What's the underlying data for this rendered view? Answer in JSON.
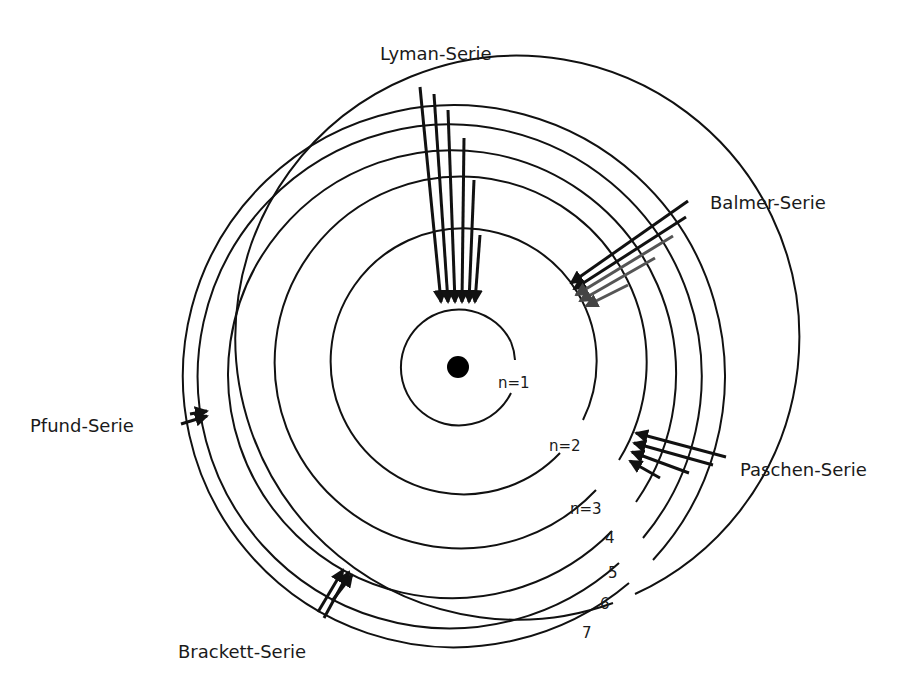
{
  "diagram": {
    "nucleus": {
      "label": ""
    },
    "orbit_labels": [
      "n=1",
      "n=2",
      "n=3",
      "4",
      "5",
      "6",
      "7"
    ],
    "series": [
      {
        "name": "Lyman-Serie",
        "target_level": 1,
        "transitions_from": [
          2,
          3,
          4,
          5,
          6,
          7
        ]
      },
      {
        "name": "Balmer-Serie",
        "target_level": 2,
        "transitions_from": [
          3,
          4,
          5,
          6,
          7
        ]
      },
      {
        "name": "Paschen-Serie",
        "target_level": 3,
        "transitions_from": [
          4,
          5,
          6,
          7
        ]
      },
      {
        "name": "Brackett-Serie",
        "target_level": 4,
        "transitions_from": [
          5,
          6,
          7
        ]
      },
      {
        "name": "Pfund-Serie",
        "target_level": 5,
        "transitions_from": [
          6,
          7
        ]
      }
    ],
    "colors": {
      "line": "#111111",
      "balmer_gradient": "#555555",
      "background": "#ffffff"
    }
  }
}
